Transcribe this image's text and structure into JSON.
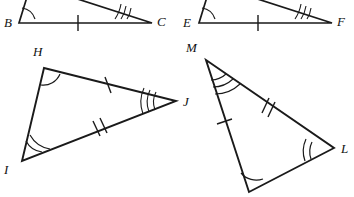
{
  "figure": {
    "stroke_color": "#1a1a1a",
    "background_color": "#ffffff",
    "label_color": "#111111",
    "stroke_width": 1.6
  },
  "triangles": [
    {
      "id": "top-left",
      "name": "triangle-abc",
      "note": "apex above top edge of image, cropped",
      "vertices": [
        {
          "name": "B",
          "label": "B",
          "x": 19,
          "y": 23,
          "label_x": 4,
          "label_y": 27,
          "arcs": 1
        },
        {
          "name": "C",
          "label": "C",
          "x": 152,
          "y": 23,
          "label_x": 157,
          "label_y": 26,
          "arcs": 3
        },
        {
          "name": "A",
          "label": "",
          "x": 31,
          "y": -16,
          "label_x": 0,
          "label_y": 0,
          "arcs": 0
        }
      ],
      "sides": [
        {
          "name": "BC",
          "from": "B",
          "to": "C",
          "ticks": 1
        },
        {
          "name": "AB",
          "from": "A",
          "to": "B",
          "ticks": 0
        },
        {
          "name": "AC",
          "from": "A",
          "to": "C",
          "ticks": 0
        }
      ]
    },
    {
      "id": "top-right",
      "name": "triangle-def",
      "note": "apex above top edge of image, cropped",
      "vertices": [
        {
          "name": "E",
          "label": "E",
          "x": 199,
          "y": 23,
          "label_x": 183,
          "label_y": 27,
          "arcs": 1
        },
        {
          "name": "F",
          "label": "F",
          "x": 332,
          "y": 23,
          "label_x": 337,
          "label_y": 26,
          "arcs": 3
        },
        {
          "name": "D",
          "label": "",
          "x": 211,
          "y": -16,
          "label_x": 0,
          "label_y": 0,
          "arcs": 0
        }
      ],
      "sides": [
        {
          "name": "EF",
          "from": "E",
          "to": "F",
          "ticks": 1
        },
        {
          "name": "DE",
          "from": "D",
          "to": "E",
          "ticks": 0
        },
        {
          "name": "DF",
          "from": "D",
          "to": "F",
          "ticks": 0
        }
      ]
    },
    {
      "id": "bottom-left",
      "name": "triangle-hij",
      "note": "full triangle visible",
      "vertices": [
        {
          "name": "H",
          "label": "H",
          "x": 44,
          "y": 68,
          "label_x": 33,
          "label_y": 56,
          "arcs": 1
        },
        {
          "name": "I",
          "label": "I",
          "x": 22,
          "y": 161,
          "label_x": 4,
          "label_y": 174,
          "arcs": 2
        },
        {
          "name": "J",
          "label": "J",
          "x": 176,
          "y": 101,
          "label_x": 183,
          "label_y": 106,
          "arcs": 3
        }
      ],
      "sides": [
        {
          "name": "HJ",
          "from": "H",
          "to": "J",
          "ticks": 1
        },
        {
          "name": "IJ",
          "from": "I",
          "to": "J",
          "ticks": 2
        },
        {
          "name": "HI",
          "from": "H",
          "to": "I",
          "ticks": 0
        }
      ]
    },
    {
      "id": "bottom-right",
      "name": "triangle-mkl",
      "note": "vertex K label cropped at bottom edge",
      "vertices": [
        {
          "name": "M",
          "label": "M",
          "x": 206,
          "y": 60,
          "label_x": 186,
          "label_y": 52,
          "arcs": 3
        },
        {
          "name": "K",
          "label": "K",
          "x": 249,
          "y": 192,
          "label_x": 242,
          "label_y": 206,
          "arcs": 1
        },
        {
          "name": "L",
          "label": "L",
          "x": 334,
          "y": 148,
          "label_x": 341,
          "label_y": 153,
          "arcs": 2
        }
      ],
      "sides": [
        {
          "name": "MK",
          "from": "M",
          "to": "K",
          "ticks": 1
        },
        {
          "name": "ML",
          "from": "M",
          "to": "L",
          "ticks": 2
        },
        {
          "name": "KL",
          "from": "K",
          "to": "L",
          "ticks": 0
        }
      ]
    }
  ],
  "labels": {
    "B": "B",
    "C": "C",
    "E": "E",
    "F": "F",
    "H": "H",
    "I": "I",
    "J": "J",
    "L": "L",
    "M": "M",
    "K": "K"
  }
}
